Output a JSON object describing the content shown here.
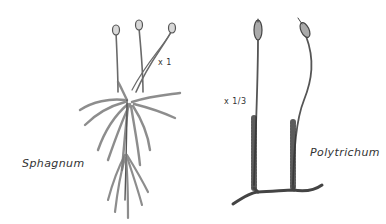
{
  "figure": {
    "plants": [
      {
        "name": "Sphagnum",
        "scale": "x 1"
      },
      {
        "name": "Polytrichum",
        "scale": "x 1/3"
      }
    ]
  }
}
